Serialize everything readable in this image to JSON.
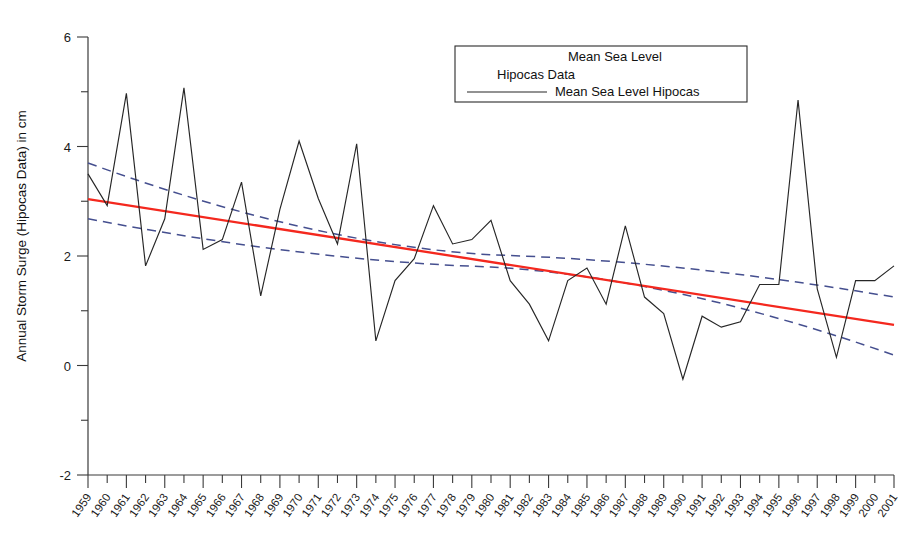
{
  "chart_data": {
    "type": "line",
    "title": "",
    "xlabel": "",
    "ylabel": "Annual Storm Surge (Hipocas Data) in cm",
    "xlim": [
      1959,
      2001
    ],
    "ylim": [
      -2,
      6
    ],
    "ytick_major": [
      -2,
      0,
      2,
      4,
      6
    ],
    "ytick_minor": [
      -1,
      1,
      3,
      5
    ],
    "grid": false,
    "legend_position": "top-center",
    "legend_title_lines": [
      "Mean Sea Level",
      "Hipocas Data"
    ],
    "categories": [
      "1959",
      "1960",
      "1961",
      "1962",
      "1963",
      "1964",
      "1965",
      "1966",
      "1967",
      "1968",
      "1969",
      "1970",
      "1971",
      "1972",
      "1973",
      "1974",
      "1975",
      "1976",
      "1977",
      "1978",
      "1979",
      "1980",
      "1981",
      "1982",
      "1983",
      "1984",
      "1985",
      "1986",
      "1987",
      "1988",
      "1989",
      "1990",
      "1991",
      "1992",
      "1993",
      "1994",
      "1995",
      "1996",
      "1997",
      "1998",
      "1999",
      "2000",
      "2001"
    ],
    "series": [
      {
        "name": "Mean Sea Level Hipocas",
        "style": "solid",
        "color": "#262626",
        "values": [
          3.5,
          2.92,
          4.97,
          1.82,
          2.68,
          5.07,
          2.12,
          2.3,
          3.35,
          1.27,
          2.85,
          4.1,
          3.05,
          2.22,
          4.05,
          0.45,
          1.55,
          1.95,
          2.92,
          2.22,
          2.3,
          2.65,
          1.55,
          1.12,
          0.45,
          1.55,
          1.78,
          1.12,
          2.55,
          1.25,
          0.95,
          -0.25,
          0.9,
          0.7,
          0.8,
          1.48,
          1.48,
          4.85,
          1.4,
          0.15,
          1.55,
          1.55,
          1.82
        ]
      }
    ],
    "trend_line": {
      "name": "Linear trend",
      "color": "#f4281e",
      "style": "solid",
      "x_start": 1959,
      "x_end": 2001,
      "y_start": 3.04,
      "y_end": 0.74
    },
    "confidence_bands": [
      {
        "name": "Upper confidence limit",
        "color": "#454f8f",
        "style": "dashed",
        "x_start": 1959,
        "x_end": 2001,
        "y_start": 3.7,
        "y_mid": 2.02,
        "y_end": 1.25
      },
      {
        "name": "Lower confidence limit",
        "color": "#454f8f",
        "style": "dashed",
        "x_start": 1959,
        "x_end": 2001,
        "y_start": 2.68,
        "y_mid": 1.8,
        "y_end": 0.19
      }
    ],
    "legend_entries": [
      {
        "label": "Mean Sea Level Hipocas",
        "color": "#262626",
        "style": "solid"
      }
    ]
  }
}
